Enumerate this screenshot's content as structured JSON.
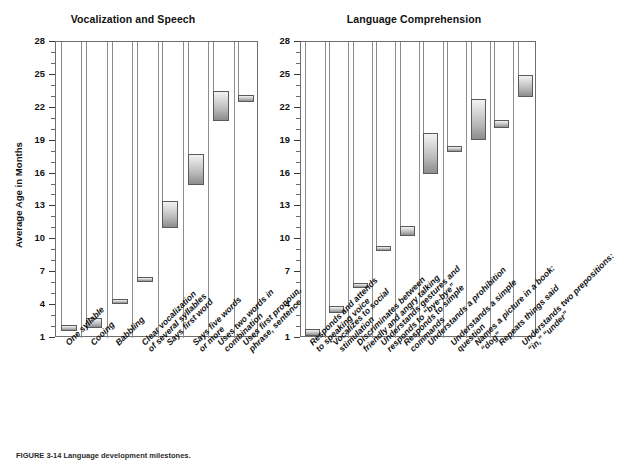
{
  "figure": {
    "caption": "FIGURE 3-14  Language development milestones.",
    "axis": {
      "ylabel": "Average Age in Months"
    }
  },
  "chart_data": [
    {
      "type": "bar",
      "title": "Vocalization and Speech",
      "xlabel": "",
      "ylabel": "Average Age in Months",
      "ylim": [
        1,
        28
      ],
      "yticks": [
        1,
        4,
        7,
        10,
        13,
        16,
        19,
        22,
        25,
        28
      ],
      "grid": false,
      "legend": "none",
      "note": "Floating range bars: each bar spans the low-to-high average age in months for the milestone.",
      "categories": [
        "One syllable",
        "Cooing",
        "Babbling",
        "Clear vocalization\nof several syllables",
        "Says first word",
        "Says five words\nor more",
        "Uses two words in\ncombination",
        "Uses first pronoun,\nphrase, sentence"
      ],
      "low": [
        1.6,
        1.9,
        4.1,
        6.2,
        11.0,
        15.0,
        20.8,
        22.5
      ],
      "high": [
        2.2,
        2.8,
        4.6,
        6.6,
        13.5,
        17.8,
        23.5,
        23.2
      ]
    },
    {
      "type": "bar",
      "title": "Language Comprehension",
      "xlabel": "",
      "ylabel": "Average Age in Months",
      "ylim": [
        1,
        28
      ],
      "yticks": [
        1,
        4,
        7,
        10,
        13,
        16,
        19,
        22,
        25,
        28
      ],
      "grid": false,
      "legend": "none",
      "note": "Floating range bars: each bar spans the low-to-high average age in months for the milestone.",
      "categories": [
        "Responds and attends\nto speaking voice",
        "Vocalizes to social\nstimulation",
        "Discriminates between\nfriendly and angry talking",
        "Understands gestures and\nresponds to “bye-bye”",
        "Responds to simple\ncommands",
        "Understands a prohibition",
        "Understands a simple\nquestion",
        "Names a picture in a book:\n“dog”",
        "Repeats things said",
        "Understands two prepositions:\n“in,” “under”"
      ],
      "low": [
        1.2,
        3.3,
        5.6,
        9.0,
        10.3,
        16.0,
        18.0,
        19.1,
        20.2,
        23.0
      ],
      "high": [
        1.8,
        3.9,
        6.0,
        9.4,
        11.2,
        19.7,
        18.5,
        22.8,
        20.9,
        25.0
      ]
    }
  ]
}
